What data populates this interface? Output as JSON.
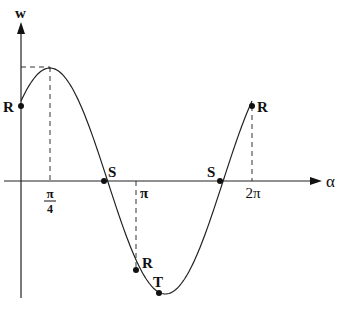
{
  "diagram": {
    "type": "function-graph",
    "axes": {
      "y_label": "w",
      "x_label": "α",
      "origin_px": [
        21,
        181
      ],
      "x_end_px": 320,
      "y_top_px": 24,
      "y_bottom_px": 298
    },
    "ticks": {
      "pi_over_4": {
        "num": "π",
        "den": "4"
      },
      "pi": "π",
      "two_pi": "2π"
    },
    "points": [
      {
        "label": "R",
        "alpha": "0",
        "px": [
          21,
          106
        ]
      },
      {
        "label": "S",
        "alpha": "3π/4",
        "px": [
          104,
          181
        ]
      },
      {
        "label": "R",
        "alpha": "π",
        "px": [
          136,
          270
        ]
      },
      {
        "label": "T",
        "alpha": "5π/4",
        "px": [
          159,
          293
        ]
      },
      {
        "label": "S",
        "alpha": "7π/4",
        "px": [
          220,
          181
        ]
      },
      {
        "label": "R",
        "alpha": "2π",
        "px": [
          252,
          106
        ]
      }
    ],
    "peak": {
      "alpha": "π/4",
      "px": [
        50,
        67
      ]
    },
    "colors": {
      "ink": "#111111",
      "background": "#ffffff"
    }
  }
}
